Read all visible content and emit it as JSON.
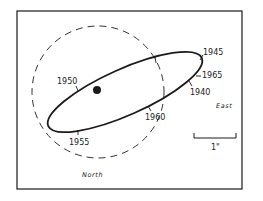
{
  "diagram": {
    "type": "binary-star-orbit",
    "epoch_labels": [
      {
        "id": "1945",
        "text": "1945",
        "x": 203,
        "y": 55
      },
      {
        "id": "1965",
        "text": "1965",
        "x": 202,
        "y": 78
      },
      {
        "id": "1940",
        "text": "1940",
        "x": 190,
        "y": 95
      },
      {
        "id": "1950",
        "text": "1950",
        "x": 57,
        "y": 84
      },
      {
        "id": "1960",
        "text": "1960",
        "x": 145,
        "y": 120
      },
      {
        "id": "1955",
        "text": "1955",
        "x": 69,
        "y": 145
      }
    ],
    "directions": {
      "east": "East",
      "north": "North"
    },
    "scale": {
      "label": "1\""
    },
    "colors": {
      "ink": "#1a1a1a",
      "background": "#ffffff"
    }
  }
}
